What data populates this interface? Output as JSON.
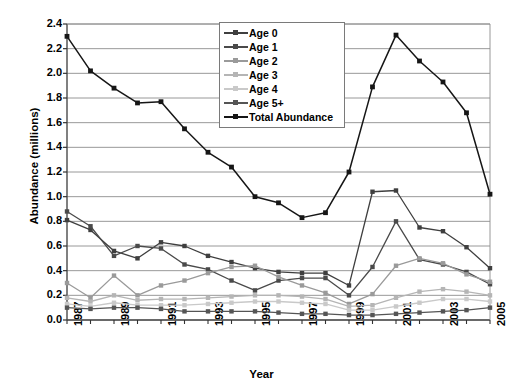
{
  "chart_data": {
    "type": "line",
    "title": "",
    "xlabel": "Year",
    "ylabel": "Abundance (millions)",
    "xlim": [
      1987,
      2005
    ],
    "ylim": [
      0.0,
      2.4
    ],
    "ytick_step": 0.2,
    "xtick_step": 2,
    "grid": true,
    "legend_position": "top-center",
    "x": [
      1987,
      1988,
      1989,
      1990,
      1991,
      1992,
      1993,
      1994,
      1995,
      1996,
      1997,
      1998,
      1999,
      2000,
      2001,
      2002,
      2003,
      2004,
      2005
    ],
    "ytick_labels": [
      "0.0",
      "0.2",
      "0.4",
      "0.6",
      "0.8",
      "1.0",
      "1.2",
      "1.4",
      "1.6",
      "1.8",
      "2.0",
      "2.2",
      "2.4"
    ],
    "xtick_labels": [
      "1987",
      "1989",
      "1991",
      "1993",
      "1995",
      "1997",
      "1999",
      "2001",
      "2003",
      "2005"
    ],
    "series": [
      {
        "name": "Age 0",
        "color": "#3f3f3f",
        "values": [
          0.81,
          0.73,
          0.56,
          0.5,
          0.63,
          0.6,
          0.52,
          0.47,
          0.42,
          0.39,
          0.38,
          0.38,
          0.28,
          1.04,
          1.05,
          0.75,
          0.72,
          0.59,
          0.42
        ]
      },
      {
        "name": "Age 1",
        "color": "#4a4a4a",
        "values": [
          0.88,
          0.76,
          0.52,
          0.6,
          0.58,
          0.45,
          0.41,
          0.32,
          0.24,
          0.32,
          0.34,
          0.34,
          0.2,
          0.43,
          0.8,
          0.49,
          0.45,
          0.39,
          0.29
        ]
      },
      {
        "name": "Age 2",
        "color": "#9a9a9a",
        "values": [
          0.3,
          0.18,
          0.36,
          0.2,
          0.28,
          0.32,
          0.38,
          0.43,
          0.44,
          0.35,
          0.28,
          0.22,
          0.13,
          0.21,
          0.44,
          0.5,
          0.46,
          0.37,
          0.31
        ]
      },
      {
        "name": "Age 3",
        "color": "#b5b5b5",
        "values": [
          0.18,
          0.15,
          0.2,
          0.16,
          0.17,
          0.17,
          0.18,
          0.19,
          0.2,
          0.2,
          0.19,
          0.17,
          0.11,
          0.12,
          0.18,
          0.23,
          0.25,
          0.23,
          0.2
        ]
      },
      {
        "name": "Age 4",
        "color": "#c9c9c9",
        "values": [
          0.13,
          0.11,
          0.14,
          0.12,
          0.12,
          0.12,
          0.13,
          0.14,
          0.15,
          0.15,
          0.14,
          0.13,
          0.08,
          0.08,
          0.11,
          0.14,
          0.17,
          0.17,
          0.15
        ]
      },
      {
        "name": "Age 5+",
        "color": "#555555",
        "values": [
          0.1,
          0.09,
          0.1,
          0.1,
          0.09,
          0.07,
          0.07,
          0.07,
          0.07,
          0.06,
          0.05,
          0.05,
          0.04,
          0.04,
          0.05,
          0.06,
          0.07,
          0.08,
          0.1
        ]
      },
      {
        "name": "Total Abundance",
        "color": "#161616",
        "values": [
          2.3,
          2.02,
          1.88,
          1.76,
          1.77,
          1.55,
          1.36,
          1.24,
          1.0,
          0.95,
          0.83,
          0.87,
          1.2,
          1.89,
          2.31,
          2.1,
          1.93,
          1.68,
          1.02
        ]
      }
    ]
  },
  "legend": {
    "items": [
      {
        "label": "Age 0"
      },
      {
        "label": "Age 1"
      },
      {
        "label": "Age 2"
      },
      {
        "label": "Age 3"
      },
      {
        "label": "Age 4"
      },
      {
        "label": "Age 5+"
      },
      {
        "label": "Total Abundance"
      }
    ]
  },
  "axis_titles": {
    "x": "Year",
    "y": "Abundance (millions)"
  }
}
